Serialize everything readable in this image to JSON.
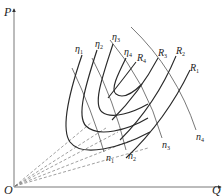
{
  "diagram": {
    "axes": {
      "y_label": "P",
      "x_label": "Q",
      "origin_label": "O"
    },
    "efficiency_curves": [
      {
        "label": "η",
        "sub": "1"
      },
      {
        "label": "η",
        "sub": "2"
      },
      {
        "label": "η",
        "sub": "3"
      },
      {
        "label": "η",
        "sub": "4"
      }
    ],
    "resistance_curves": [
      {
        "label": "R",
        "sub": "1"
      },
      {
        "label": "R",
        "sub": "2"
      },
      {
        "label": "R",
        "sub": "3"
      },
      {
        "label": "R",
        "sub": "4"
      }
    ],
    "speed_lines": [
      {
        "label": "n",
        "sub": "1"
      },
      {
        "label": "n",
        "sub": "2"
      },
      {
        "label": "n",
        "sub": "3"
      },
      {
        "label": "n",
        "sub": "4"
      }
    ],
    "colors": {
      "curve": "#2a2a2a",
      "thin_line": "#555555",
      "dashed": "#777777",
      "axis": "#444444"
    }
  }
}
